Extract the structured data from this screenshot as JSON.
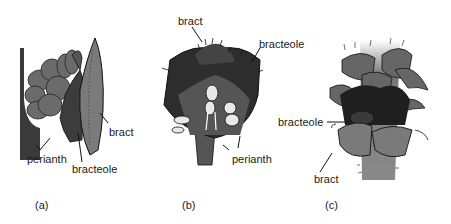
{
  "figures": [
    {
      "id": "a",
      "caption": "(a)",
      "labels": {
        "bract": "bract",
        "bracteole": "bracteole",
        "perianth": "perianth"
      }
    },
    {
      "id": "b",
      "caption": "(b)",
      "labels": {
        "bract": "bract",
        "bracteole": "bracteole",
        "perianth": "perianth"
      }
    },
    {
      "id": "c",
      "caption": "(c)",
      "labels": {
        "bracteole": "bracteole",
        "bract": "bract"
      }
    }
  ],
  "colors": {
    "dark": "#2a2a2a",
    "mid": "#555555",
    "light": "#8a8a8a",
    "pale": "#d8d8d8",
    "line": "#111111"
  }
}
